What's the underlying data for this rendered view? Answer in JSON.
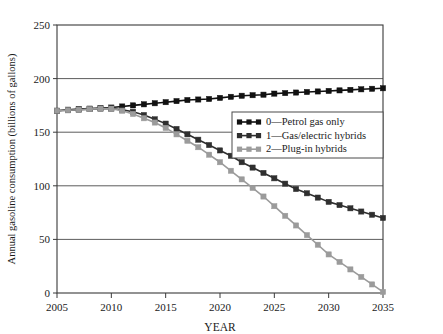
{
  "chart_data": {
    "type": "line",
    "title": "",
    "xlabel": "YEAR",
    "ylabel": "Annual gasoline consumption (billions of gallons)",
    "xlim": [
      2005,
      2035
    ],
    "ylim": [
      0,
      250
    ],
    "xticks": [
      "2005",
      "2010",
      "2015",
      "2020",
      "2025",
      "2030",
      "2035"
    ],
    "yticks": [
      "0",
      "50",
      "100",
      "150",
      "200",
      "250"
    ],
    "grid": true,
    "legend_position": "middle-right",
    "x": [
      2005,
      2006,
      2007,
      2008,
      2009,
      2010,
      2011,
      2012,
      2013,
      2014,
      2015,
      2016,
      2017,
      2018,
      2019,
      2020,
      2021,
      2022,
      2023,
      2024,
      2025,
      2026,
      2027,
      2028,
      2029,
      2030,
      2031,
      2032,
      2033,
      2034,
      2035
    ],
    "series": [
      {
        "name": "0—Petrol gas only",
        "color": "#111111",
        "marker": "square",
        "values": [
          170,
          171,
          171.5,
          172,
          172.5,
          173,
          174,
          175,
          176,
          177,
          178,
          179,
          180,
          180.5,
          181,
          182,
          183,
          184,
          184.5,
          185,
          186,
          186.5,
          187,
          187.5,
          188,
          188.5,
          189,
          189.5,
          190,
          190.5,
          191
        ]
      },
      {
        "name": "1—Gas/electric hybrids",
        "color": "#2f2f2f",
        "marker": "square",
        "values": [
          170,
          170.5,
          171,
          171.5,
          172,
          172,
          171,
          169,
          166,
          162,
          158,
          153,
          148,
          143,
          138,
          133,
          128,
          122,
          117,
          112,
          107,
          102,
          97,
          93,
          89,
          85,
          82,
          79,
          76,
          73,
          70
        ]
      },
      {
        "name": "2—Plug-in hybrids",
        "color": "#9b9b9b",
        "marker": "square",
        "values": [
          170,
          170.5,
          171,
          171.5,
          172,
          172,
          170,
          167,
          163,
          159,
          154,
          148,
          142,
          136,
          129,
          122,
          114,
          106,
          98,
          90,
          81,
          72,
          63,
          54,
          45,
          36,
          29,
          22,
          15,
          8,
          1
        ]
      }
    ]
  },
  "legend": {
    "entries": [
      {
        "label": "0—Petrol gas only",
        "color": "#111111"
      },
      {
        "label": "1—Gas/electric hybrids",
        "color": "#2f2f2f"
      },
      {
        "label": "2—Plug-in hybrids",
        "color": "#9b9b9b"
      }
    ]
  }
}
